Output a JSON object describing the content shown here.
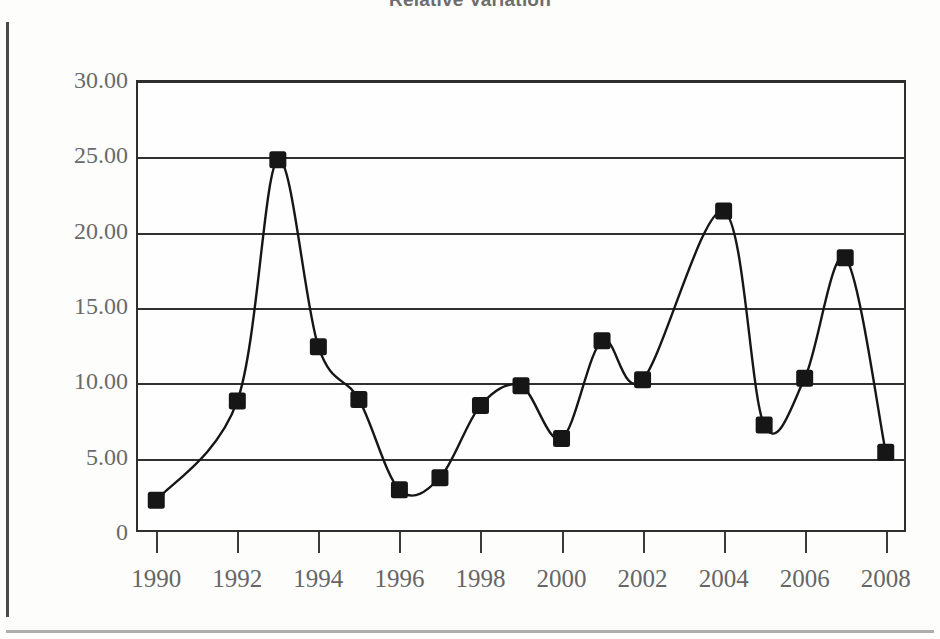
{
  "title": "Relative Variation",
  "axis": {
    "y_ticks": [
      "30.00",
      "25.00",
      "20.00",
      "15.00",
      "10.00",
      "5.00",
      "0"
    ],
    "x_ticks": [
      "1990",
      "1992",
      "1994",
      "1996",
      "1998",
      "2000",
      "2002",
      "2004",
      "2006",
      "2008"
    ]
  },
  "colors": {
    "line": "#161616",
    "marker": "#161616",
    "grid": "#303030",
    "text": "#6a6a6a",
    "frame": "#2e2e2e"
  },
  "chart_data": {
    "type": "line",
    "title": "Relative Variation",
    "xlabel": "",
    "ylabel": "",
    "xlim": [
      1989.5,
      2008.5
    ],
    "ylim": [
      0,
      30
    ],
    "grid": true,
    "legend": "none",
    "ytick_labels": [
      "30.00",
      "25.00",
      "20.00",
      "15.00",
      "10.00",
      "5.00",
      "0"
    ],
    "ytick_values": [
      30,
      25,
      20,
      15,
      10,
      5,
      0
    ],
    "xtick_labels": [
      "1990",
      "1992",
      "1994",
      "1996",
      "1998",
      "2000",
      "2002",
      "2004",
      "2006",
      "2008"
    ],
    "xtick_values": [
      1990,
      1992,
      1994,
      1996,
      1998,
      2000,
      2002,
      2004,
      2006,
      2008
    ],
    "marker": "square",
    "x": [
      1990,
      1992,
      1993,
      1994,
      1995,
      1996,
      1997,
      1998,
      1999,
      2000,
      2001,
      2002,
      2004,
      2005,
      2006,
      2007,
      2008
    ],
    "series": [
      {
        "name": "Relative Variation",
        "values": [
          2.1,
          8.7,
          24.7,
          12.3,
          8.8,
          2.8,
          3.6,
          8.4,
          9.7,
          6.2,
          12.7,
          10.1,
          21.3,
          7.1,
          10.2,
          18.2,
          5.3
        ]
      }
    ],
    "points": [
      {
        "x": 1990,
        "y": 2.1
      },
      {
        "x": 1992,
        "y": 8.7
      },
      {
        "x": 1993,
        "y": 24.7
      },
      {
        "x": 1994,
        "y": 12.3
      },
      {
        "x": 1995,
        "y": 8.8
      },
      {
        "x": 1996,
        "y": 2.8
      },
      {
        "x": 1997,
        "y": 3.6
      },
      {
        "x": 1998,
        "y": 8.4
      },
      {
        "x": 1999,
        "y": 9.7
      },
      {
        "x": 2000,
        "y": 6.2
      },
      {
        "x": 2001,
        "y": 12.7
      },
      {
        "x": 2002,
        "y": 10.1
      },
      {
        "x": 2004,
        "y": 21.3
      },
      {
        "x": 2005,
        "y": 7.1
      },
      {
        "x": 2006,
        "y": 10.2
      },
      {
        "x": 2007,
        "y": 18.2
      },
      {
        "x": 2008,
        "y": 5.3
      }
    ]
  }
}
